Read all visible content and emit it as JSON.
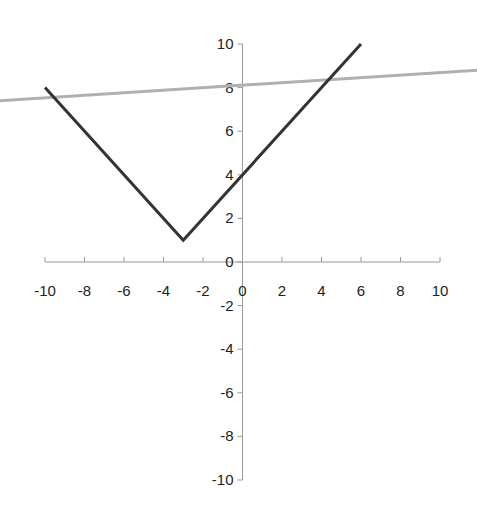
{
  "chart_data": {
    "type": "line",
    "title": "",
    "xlabel": "",
    "ylabel": "",
    "xlim": [
      -10,
      10
    ],
    "ylim": [
      -10,
      10
    ],
    "grid": false,
    "legend": null,
    "x_ticks": [
      "-10",
      "-8",
      "-6",
      "-4",
      "-2",
      "0",
      "2",
      "4",
      "6",
      "8",
      "10"
    ],
    "y_ticks": [
      "10",
      "8",
      "6",
      "4",
      "2",
      "0",
      "-2",
      "-4",
      "-6",
      "-8",
      "-10"
    ],
    "series": [
      {
        "name": "y = |x + 3| + 1",
        "color": "#333333",
        "points": [
          [
            -10,
            8
          ],
          [
            -3,
            1
          ],
          [
            6,
            10
          ]
        ]
      }
    ],
    "annotations": [
      {
        "type": "overlay-line",
        "description": "light gray nearly-horizontal line crossing the plot near y=8",
        "color": "#b0b0b0",
        "points": [
          [
            -12.3,
            7.4
          ],
          [
            11.9,
            8.8
          ]
        ]
      }
    ]
  },
  "axes": {
    "x_origin_label": "0",
    "y_origin_label": "0"
  }
}
